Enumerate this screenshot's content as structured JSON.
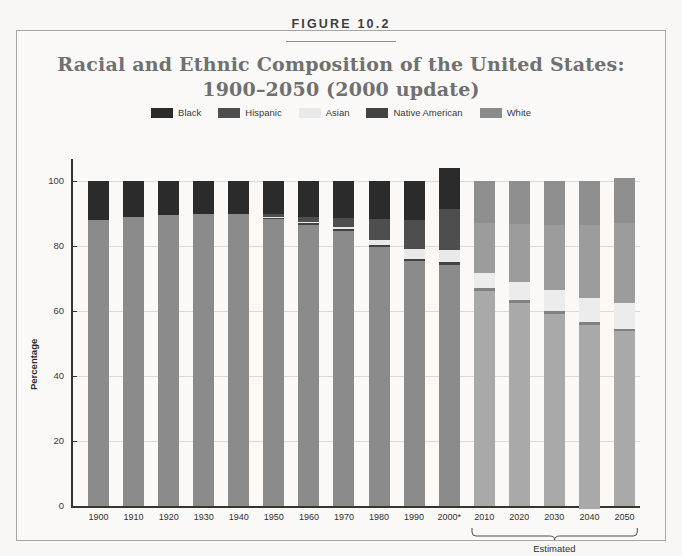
{
  "figure": {
    "label": "FIGURE 10.2",
    "title_line1": "Racial and Ethnic Composition of the United States:",
    "title_line2": "1900–2050 (2000 update)"
  },
  "colors": {
    "black": "#2b2b2b",
    "hispanic": "#4e4e4e",
    "asian": "#e9e9e9",
    "native_american": "#434343",
    "white": "#8b8b8b",
    "black_proj": "#8f8f8f",
    "hispanic_proj": "#9c9c9c",
    "asian_proj": "#ececec",
    "native_american_proj": "#818181",
    "white_proj": "#a9a9a9",
    "grid": "#dcdad6",
    "axis": "#37352f",
    "title_text": "#707070",
    "frame_border": "#a8a6a2",
    "page_background": "#f8f7f5"
  },
  "legend": {
    "items": [
      {
        "label": "Black",
        "swatch": "#2b2b2b"
      },
      {
        "label": "Hispanic",
        "swatch": "#4e4e4e"
      },
      {
        "label": "Asian",
        "swatch": "#e9e9e9"
      },
      {
        "label": "Native American",
        "swatch": "#434343"
      },
      {
        "label": "White",
        "swatch": "#8b8b8b"
      }
    ]
  },
  "axes": {
    "ylabel": "Percentage",
    "yticks": [
      0,
      20,
      40,
      60,
      80,
      100
    ],
    "ylim": [
      0,
      105
    ],
    "estimated_bracket_label": "Estimated"
  },
  "chart_data": {
    "type": "bar",
    "subtype": "stacked-column",
    "title": "Racial and Ethnic Composition of the United States: 1900–2050 (2000 update)",
    "xlabel": "",
    "ylabel": "Percentage",
    "ylim": [
      0,
      105
    ],
    "yticks": [
      0,
      20,
      40,
      60,
      80,
      100
    ],
    "grid": true,
    "legend_position": "top-center",
    "stack_order_top_to_bottom": [
      "Black",
      "Hispanic",
      "Asian",
      "Native American",
      "White"
    ],
    "categories": [
      "1900",
      "1910",
      "1920",
      "1930",
      "1940",
      "1950",
      "1960",
      "1970",
      "1980",
      "1990",
      "2000*",
      "2010",
      "2020",
      "2030",
      "2040",
      "2050"
    ],
    "estimated_categories": [
      "2010",
      "2020",
      "2030",
      "2040",
      "2050"
    ],
    "series": [
      {
        "name": "Black",
        "values": [
          12.0,
          11.0,
          10.5,
          10.0,
          10.0,
          10.0,
          11.0,
          11.5,
          11.7,
          12.0,
          12.7,
          13.0,
          13.2,
          13.4,
          13.6,
          13.9
        ]
      },
      {
        "name": "Hispanic",
        "values": [
          0.0,
          0.0,
          0.0,
          0.0,
          0.0,
          1.0,
          1.5,
          2.5,
          6.4,
          9.0,
          12.5,
          15.2,
          17.8,
          20.1,
          22.3,
          24.5
        ]
      },
      {
        "name": "Asian",
        "values": [
          0.0,
          0.0,
          0.0,
          0.0,
          0.0,
          0.3,
          0.5,
          0.8,
          1.6,
          2.9,
          3.8,
          4.8,
          5.7,
          6.6,
          7.5,
          8.0
        ]
      },
      {
        "name": "Native American",
        "values": [
          0.0,
          0.0,
          0.0,
          0.0,
          0.0,
          0.5,
          0.5,
          0.5,
          0.6,
          0.8,
          0.9,
          0.9,
          0.9,
          0.9,
          0.9,
          0.9
        ]
      },
      {
        "name": "White",
        "values": [
          88.0,
          89.0,
          89.5,
          90.0,
          90.0,
          88.2,
          86.5,
          84.7,
          79.7,
          75.3,
          74.1,
          66.1,
          62.4,
          59.0,
          56.7,
          53.7
        ]
      }
    ],
    "totals": [
      100.0,
      100.0,
      100.0,
      100.0,
      100.0,
      100.0,
      100.0,
      100.0,
      100.0,
      100.0,
      104.0,
      100.0,
      100.0,
      100.0,
      100.0,
      101.0
    ]
  }
}
